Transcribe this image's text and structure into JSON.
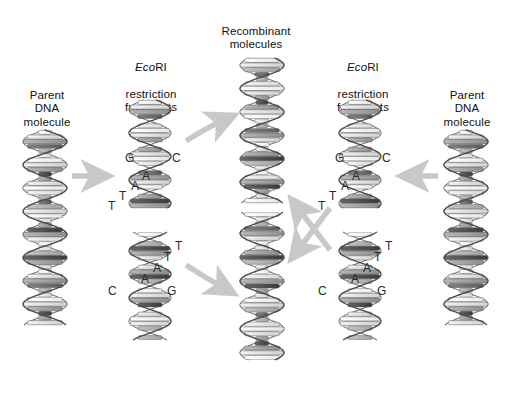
{
  "figure": {
    "background_color": "#ffffff",
    "arrow_color": "#c8c8c8",
    "base_letter_color": "#2a2a2a",
    "label_color": "#111111",
    "width": 511,
    "height": 405
  },
  "labels": {
    "parent_left": "Parent\nDNA\nmolecule",
    "parent_right": "Parent\nDNA\nmolecule",
    "fragments_left_italic": "Eco",
    "fragments_left_rest": "RI",
    "fragments_left_lines": "restriction\nfragments",
    "fragments_right_italic": "Eco",
    "fragments_right_rest": "RI",
    "fragments_right_lines": "restriction\nfragments",
    "recombinant": "Recombinant\nmolecules"
  },
  "sticky_ends": {
    "top_left": [
      "G",
      "C",
      "A",
      "A",
      "T",
      "T"
    ],
    "bottom_left": [
      "T",
      "T",
      "A",
      "A",
      "C",
      "G"
    ],
    "top_right": [
      "G",
      "C",
      "A",
      "A",
      "T",
      "T"
    ],
    "bottom_right": [
      "T",
      "T",
      "A",
      "A",
      "C",
      "G"
    ]
  },
  "base_positions": {
    "top_left": [
      {
        "t": "G",
        "x": 125,
        "y": 152
      },
      {
        "t": "C",
        "x": 172,
        "y": 152
      },
      {
        "t": "A",
        "x": 142,
        "y": 170
      },
      {
        "t": "A",
        "x": 131,
        "y": 180
      },
      {
        "t": "T",
        "x": 119,
        "y": 190
      },
      {
        "t": "T",
        "x": 108,
        "y": 200
      }
    ],
    "bottom_left": [
      {
        "t": "T",
        "x": 175,
        "y": 240
      },
      {
        "t": "T",
        "x": 164,
        "y": 251
      },
      {
        "t": "A",
        "x": 153,
        "y": 262
      },
      {
        "t": "A",
        "x": 141,
        "y": 273
      },
      {
        "t": "C",
        "x": 108,
        "y": 285
      },
      {
        "t": "G",
        "x": 167,
        "y": 285
      }
    ],
    "top_right": [
      {
        "t": "G",
        "x": 335,
        "y": 152
      },
      {
        "t": "C",
        "x": 382,
        "y": 152
      },
      {
        "t": "A",
        "x": 352,
        "y": 170
      },
      {
        "t": "A",
        "x": 341,
        "y": 180
      },
      {
        "t": "T",
        "x": 329,
        "y": 190
      },
      {
        "t": "T",
        "x": 318,
        "y": 200
      }
    ],
    "bottom_right": [
      {
        "t": "T",
        "x": 385,
        "y": 240
      },
      {
        "t": "T",
        "x": 374,
        "y": 251
      },
      {
        "t": "A",
        "x": 363,
        "y": 262
      },
      {
        "t": "A",
        "x": 351,
        "y": 273
      },
      {
        "t": "C",
        "x": 318,
        "y": 285
      },
      {
        "t": "G",
        "x": 377,
        "y": 285
      }
    ]
  },
  "columns": [
    {
      "name": "parent-dna-left",
      "label": "Parent DNA molecule"
    },
    {
      "name": "ecori-fragments-left",
      "label": "EcoRI restriction fragments"
    },
    {
      "name": "recombinant-molecules",
      "label": "Recombinant molecules"
    },
    {
      "name": "ecori-fragments-right",
      "label": "EcoRI restriction fragments"
    },
    {
      "name": "parent-dna-right",
      "label": "Parent DNA molecule"
    }
  ],
  "arrows": [
    {
      "name": "arrow-parent-left-to-fragments",
      "direction": "right"
    },
    {
      "name": "arrow-fragment-topleft-to-recombinant",
      "direction": "up-right"
    },
    {
      "name": "arrow-fragment-bottomleft-to-recombinant",
      "direction": "down-right"
    },
    {
      "name": "arrow-cross-up-left",
      "direction": "up-left"
    },
    {
      "name": "arrow-cross-down-left",
      "direction": "down-left"
    },
    {
      "name": "arrow-parent-right-to-fragments",
      "direction": "left"
    }
  ]
}
